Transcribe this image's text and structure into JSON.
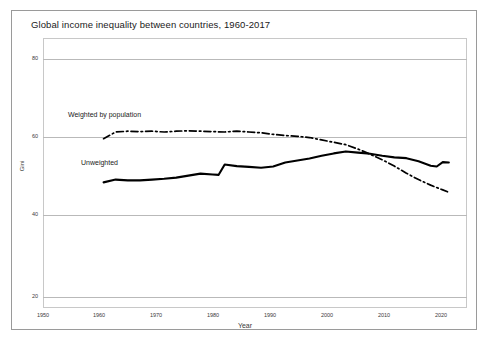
{
  "chart_data": {
    "type": "line",
    "title": "Global income inequality between countries, 1960-2017",
    "xlabel": "Year",
    "ylabel": "Gini",
    "xlim": [
      1950,
      2020
    ],
    "ylim": [
      20,
      80
    ],
    "xticks": [
      1950,
      1960,
      1970,
      1980,
      1990,
      2000,
      2010,
      2020
    ],
    "yticks": [
      20,
      40,
      60,
      80
    ],
    "grid": true,
    "legend_position": "inline-annotation",
    "series": [
      {
        "name": "Weighted by population",
        "style": "dash-dot",
        "color": "#000000",
        "x": [
          1960,
          1962,
          1964,
          1966,
          1968,
          1970,
          1972,
          1974,
          1976,
          1978,
          1980,
          1982,
          1984,
          1986,
          1988,
          1990,
          1992,
          1994,
          1996,
          1998,
          2000,
          2002,
          2004,
          2006,
          2008,
          2010,
          2012,
          2014,
          2016,
          2017
        ],
        "values": [
          59.9,
          61.6,
          61.8,
          61.7,
          61.8,
          61.6,
          61.8,
          61.9,
          61.8,
          61.7,
          61.6,
          61.8,
          61.6,
          61.4,
          61.0,
          60.7,
          60.5,
          60.2,
          59.6,
          59.0,
          58.4,
          57.3,
          56.0,
          54.6,
          53.0,
          51.2,
          49.6,
          48.2,
          47.0,
          46.4
        ]
      },
      {
        "name": "Unweighted",
        "style": "solid",
        "color": "#000000",
        "x": [
          1960,
          1962,
          1964,
          1966,
          1968,
          1970,
          1972,
          1974,
          1976,
          1978,
          1979,
          1980,
          1982,
          1984,
          1986,
          1988,
          1990,
          1992,
          1994,
          1996,
          1998,
          2000,
          2002,
          2004,
          2006,
          2008,
          2010,
          2012,
          2014,
          2015,
          2016,
          2017
        ],
        "values": [
          48.9,
          49.6,
          49.4,
          49.4,
          49.6,
          49.8,
          50.1,
          50.6,
          51.1,
          50.9,
          50.8,
          53.4,
          53.0,
          52.8,
          52.6,
          52.9,
          53.9,
          54.4,
          54.9,
          55.6,
          56.2,
          56.7,
          56.4,
          56.1,
          55.6,
          55.2,
          55.0,
          54.2,
          53.1,
          52.9,
          54.0,
          53.9
        ]
      }
    ],
    "annotations": [
      {
        "text": "Weighted by population",
        "x": 1960,
        "y": 66
      },
      {
        "text": "Unweighted",
        "x": 1963,
        "y": 56
      }
    ]
  },
  "axis": {
    "y_tick_labels": [
      "80",
      "60",
      "40",
      "20"
    ],
    "x_tick_labels": [
      "1950",
      "1960",
      "1970",
      "1980",
      "1990",
      "2000",
      "2010",
      "2020"
    ],
    "y_title": "Gini",
    "x_title": "Year"
  },
  "labels": {
    "weighted": "Weighted by population",
    "unweighted": "Unweighted"
  },
  "title": "Global income inequality between countries, 1960-2017"
}
